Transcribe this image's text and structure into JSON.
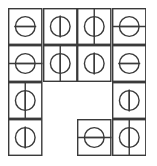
{
  "figure": {
    "kind": "line-art-diagram",
    "width": 157,
    "height": 166,
    "background_color": "#ffffff",
    "stroke_color": "#3a3a3a",
    "stroke_width": 1.4,
    "grid": {
      "rows": 4,
      "cols": 4,
      "origin_x": 8,
      "origin_y": 8,
      "cell_width": 34.5,
      "cell_height": 37.0
    },
    "legend": {
      "horizontal_bar": "circle bisected by a horizontal line",
      "vertical_bar": "circle bisected by a vertical line",
      "stem_full": "line runs edge to edge of the cell through the circle",
      "stem_inside": "line stays inside the circle only"
    },
    "cells": [
      {
        "id": "r1c1",
        "row": 1,
        "col": 1,
        "present": true,
        "symbol": "circle-with-horizontal-bar",
        "orientation": "horizontal",
        "extent": "inside",
        "left": false,
        "right": false,
        "up": false,
        "down": false
      },
      {
        "id": "r1c2",
        "row": 1,
        "col": 2,
        "present": true,
        "symbol": "circle-with-vertical-bar",
        "orientation": "vertical",
        "extent": "inside",
        "left": false,
        "right": false,
        "up": false,
        "down": false
      },
      {
        "id": "r1c3",
        "row": 1,
        "col": 3,
        "present": true,
        "symbol": "circle-with-vertical-bar",
        "orientation": "vertical",
        "extent": "full",
        "left": false,
        "right": false,
        "up": true,
        "down": true
      },
      {
        "id": "r1c4",
        "row": 1,
        "col": 4,
        "present": true,
        "symbol": "circle-with-horizontal-bar",
        "orientation": "horizontal",
        "extent": "full",
        "left": true,
        "right": true,
        "up": false,
        "down": false
      },
      {
        "id": "r2c1",
        "row": 2,
        "col": 1,
        "present": true,
        "symbol": "circle-with-horizontal-bar",
        "orientation": "horizontal",
        "extent": "full",
        "left": true,
        "right": true,
        "up": false,
        "down": false
      },
      {
        "id": "r2c2",
        "row": 2,
        "col": 2,
        "present": true,
        "symbol": "circle-with-vertical-bar",
        "orientation": "vertical",
        "extent": "full",
        "left": false,
        "right": false,
        "up": true,
        "down": true
      },
      {
        "id": "r2c3",
        "row": 2,
        "col": 3,
        "present": true,
        "symbol": "circle-with-vertical-bar",
        "orientation": "vertical",
        "extent": "inside",
        "left": false,
        "right": false,
        "up": false,
        "down": false
      },
      {
        "id": "r2c4",
        "row": 2,
        "col": 4,
        "present": true,
        "symbol": "circle-with-horizontal-bar",
        "orientation": "horizontal",
        "extent": "inside",
        "left": false,
        "right": false,
        "up": false,
        "down": false
      },
      {
        "id": "r3c1",
        "row": 3,
        "col": 1,
        "present": true,
        "symbol": "circle-with-vertical-bar",
        "orientation": "vertical",
        "extent": "full",
        "left": false,
        "right": false,
        "up": true,
        "down": true
      },
      {
        "id": "r3c2",
        "row": 3,
        "col": 2,
        "present": false,
        "symbol": "empty",
        "orientation": "none",
        "extent": "none",
        "left": false,
        "right": false,
        "up": false,
        "down": false
      },
      {
        "id": "r3c3",
        "row": 3,
        "col": 3,
        "present": false,
        "symbol": "empty",
        "orientation": "none",
        "extent": "none",
        "left": false,
        "right": false,
        "up": false,
        "down": false
      },
      {
        "id": "r3c4",
        "row": 3,
        "col": 4,
        "present": true,
        "symbol": "circle-with-vertical-bar",
        "orientation": "vertical",
        "extent": "inside",
        "left": false,
        "right": false,
        "up": false,
        "down": false
      },
      {
        "id": "r4c1",
        "row": 4,
        "col": 1,
        "present": true,
        "symbol": "circle-with-vertical-bar",
        "orientation": "vertical",
        "extent": "inside",
        "left": false,
        "right": false,
        "up": false,
        "down": false
      },
      {
        "id": "r4c2",
        "row": 4,
        "col": 2,
        "present": false,
        "symbol": "empty",
        "orientation": "none",
        "extent": "none",
        "left": false,
        "right": false,
        "up": false,
        "down": false
      },
      {
        "id": "r4c3",
        "row": 4,
        "col": 3,
        "present": true,
        "symbol": "circle-with-horizontal-bar",
        "orientation": "horizontal",
        "extent": "full",
        "left": true,
        "right": true,
        "up": false,
        "down": false
      },
      {
        "id": "r4c4",
        "row": 4,
        "col": 4,
        "present": true,
        "symbol": "circle-with-vertical-bar",
        "orientation": "vertical",
        "extent": "full",
        "left": false,
        "right": false,
        "up": true,
        "down": true
      }
    ]
  }
}
